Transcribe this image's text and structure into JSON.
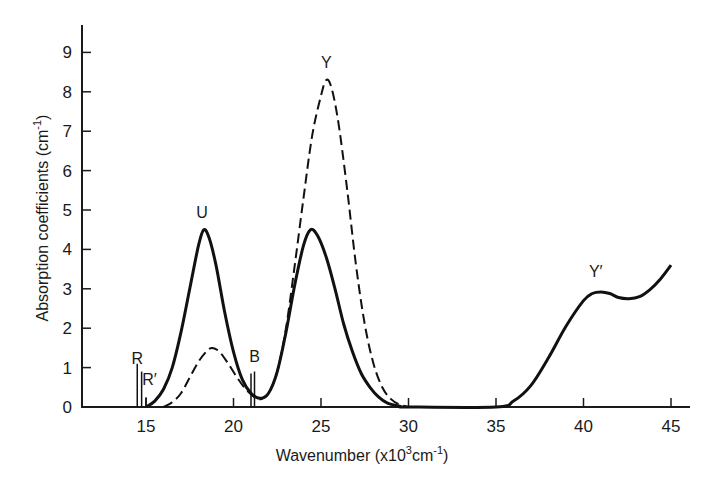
{
  "chart_data": {
    "type": "line",
    "title": "",
    "xlabel": "Wavenumber (x10³cm⁻¹)",
    "ylabel": "Absorption coefficients (cm⁻¹)",
    "xlim": [
      11.3,
      46
    ],
    "ylim": [
      0,
      9.6
    ],
    "x_ticks": [
      15,
      20,
      25,
      30,
      35,
      40,
      45
    ],
    "y_ticks": [
      0,
      1,
      2,
      3,
      4,
      5,
      6,
      7,
      8,
      9
    ],
    "grid": false,
    "legend": null,
    "series": [
      {
        "name": "solid",
        "style": "solid",
        "points": [
          [
            15.0,
            0.0
          ],
          [
            15.5,
            0.15
          ],
          [
            16.0,
            0.45
          ],
          [
            16.5,
            1.0
          ],
          [
            17.0,
            1.9
          ],
          [
            17.5,
            3.0
          ],
          [
            18.0,
            4.1
          ],
          [
            18.3,
            4.5
          ],
          [
            18.6,
            4.3
          ],
          [
            19.0,
            3.6
          ],
          [
            19.5,
            2.4
          ],
          [
            20.0,
            1.4
          ],
          [
            20.5,
            0.7
          ],
          [
            21.0,
            0.35
          ],
          [
            21.5,
            0.22
          ],
          [
            22.0,
            0.35
          ],
          [
            22.5,
            0.9
          ],
          [
            23.0,
            1.9
          ],
          [
            23.5,
            3.1
          ],
          [
            24.0,
            4.1
          ],
          [
            24.4,
            4.5
          ],
          [
            24.8,
            4.35
          ],
          [
            25.3,
            3.8
          ],
          [
            25.8,
            3.0
          ],
          [
            26.3,
            2.1
          ],
          [
            26.8,
            1.4
          ],
          [
            27.3,
            0.85
          ],
          [
            27.8,
            0.5
          ],
          [
            28.3,
            0.25
          ],
          [
            28.8,
            0.1
          ],
          [
            29.5,
            0.02
          ],
          [
            30.0,
            0.0
          ],
          [
            35.0,
            0.0
          ],
          [
            36.0,
            0.15
          ],
          [
            37.0,
            0.55
          ],
          [
            38.0,
            1.25
          ],
          [
            39.0,
            2.05
          ],
          [
            40.0,
            2.7
          ],
          [
            40.5,
            2.88
          ],
          [
            41.0,
            2.92
          ],
          [
            41.5,
            2.88
          ],
          [
            42.0,
            2.78
          ],
          [
            42.6,
            2.75
          ],
          [
            43.2,
            2.8
          ],
          [
            43.8,
            2.98
          ],
          [
            44.4,
            3.25
          ],
          [
            45.0,
            3.6
          ]
        ]
      },
      {
        "name": "dashed",
        "style": "dashed",
        "points": [
          [
            16.0,
            0.0
          ],
          [
            16.5,
            0.12
          ],
          [
            17.0,
            0.35
          ],
          [
            17.5,
            0.75
          ],
          [
            18.0,
            1.15
          ],
          [
            18.5,
            1.43
          ],
          [
            18.8,
            1.5
          ],
          [
            19.2,
            1.4
          ],
          [
            19.7,
            1.1
          ],
          [
            20.2,
            0.75
          ],
          [
            20.7,
            0.45
          ],
          [
            21.2,
            0.25
          ],
          [
            21.6,
            0.2
          ],
          [
            22.0,
            0.35
          ],
          [
            22.5,
            0.9
          ],
          [
            23.0,
            2.0
          ],
          [
            23.5,
            3.6
          ],
          [
            24.0,
            5.3
          ],
          [
            24.5,
            6.9
          ],
          [
            25.0,
            7.9
          ],
          [
            25.3,
            8.3
          ],
          [
            25.6,
            8.1
          ],
          [
            26.0,
            7.2
          ],
          [
            26.5,
            5.5
          ],
          [
            27.0,
            3.6
          ],
          [
            27.5,
            2.1
          ],
          [
            28.0,
            1.1
          ],
          [
            28.5,
            0.5
          ],
          [
            29.0,
            0.2
          ],
          [
            29.5,
            0.06
          ],
          [
            30.0,
            0.0
          ]
        ]
      }
    ],
    "annotations": [
      {
        "text": "R",
        "x": 14.5,
        "y": 1.1
      },
      {
        "text": "R′",
        "x": 15.2,
        "y": 0.55
      },
      {
        "text": "U",
        "x": 18.2,
        "y": 4.8
      },
      {
        "text": "B",
        "x": 21.2,
        "y": 1.15
      },
      {
        "text": "Y",
        "x": 25.3,
        "y": 8.6
      },
      {
        "text": "Y′",
        "x": 40.7,
        "y": 3.3
      }
    ],
    "sharp_lines": [
      {
        "label": "R",
        "x": 14.5,
        "height": 1.1
      },
      {
        "label": "R",
        "x": 14.75,
        "height": 0.9
      },
      {
        "label": "R′",
        "x": 15.0,
        "height": 0.25
      },
      {
        "label": "B",
        "x": 21.0,
        "height": 0.85
      },
      {
        "label": "B",
        "x": 21.2,
        "height": 0.9
      }
    ]
  },
  "axes": {
    "x_title_main": "Wavenumber (x10",
    "x_title_sup": "3",
    "x_title_unit": "cm",
    "x_title_unit_sup": "-1",
    "x_title_end": ")",
    "y_title_main": "Absorption coefficients (cm",
    "y_title_sup": "-1",
    "y_title_end": ")",
    "x_tick_labels": [
      "15",
      "20",
      "25",
      "30",
      "35",
      "40",
      "45"
    ],
    "y_tick_labels": [
      "0",
      "1",
      "2",
      "3",
      "4",
      "5",
      "6",
      "7",
      "8",
      "9"
    ]
  },
  "labels": {
    "R": "R",
    "R_prime": "R′",
    "U": "U",
    "B": "B",
    "Y": "Y",
    "Y_prime": "Y′"
  }
}
